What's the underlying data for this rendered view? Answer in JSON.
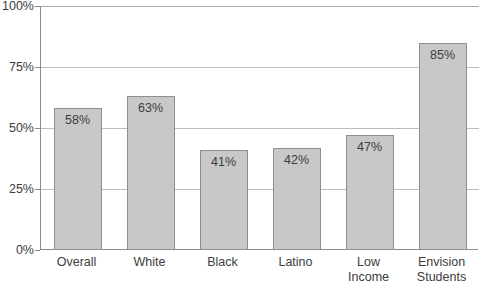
{
  "chart_data": {
    "type": "bar",
    "title": "",
    "subtitle": "",
    "xlabel": "",
    "ylabel": "",
    "categories": [
      "Overall",
      "White",
      "Black",
      "Latino",
      "Low\nIncome",
      "Envision\nStudents"
    ],
    "values": [
      58,
      63,
      41,
      42,
      47,
      85
    ],
    "value_labels": [
      "58%",
      "63%",
      "41%",
      "42%",
      "47%",
      "85%"
    ],
    "ylim": [
      0,
      100
    ],
    "ytick_values": [
      0,
      25,
      50,
      75,
      100
    ],
    "ytick_labels": [
      "0%",
      "25%",
      "50%",
      "75%",
      "100%"
    ],
    "grid": true,
    "grid_axis": "y",
    "legend": "none",
    "series": [
      {
        "name": "Percent",
        "values": [
          58,
          63,
          41,
          42,
          47,
          85
        ]
      }
    ]
  },
  "style": {
    "bar_fill": "#c8c8c8",
    "bar_stroke": "#8f8f8f",
    "grid_color": "#bdbdbd",
    "axis_color": "#8c8c8c",
    "text_color": "#3c3c3c",
    "background": "#ffffff"
  },
  "caption": {
    "text": ""
  }
}
